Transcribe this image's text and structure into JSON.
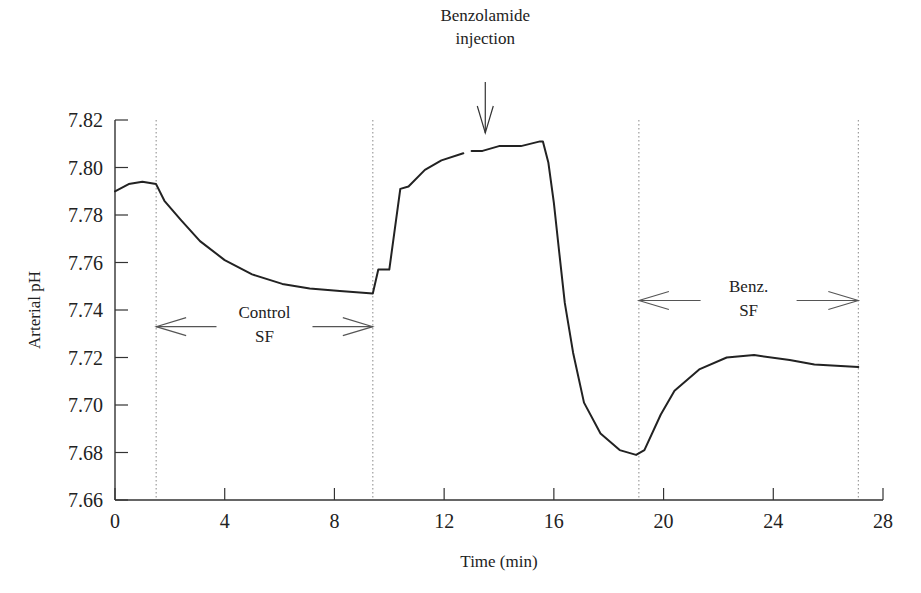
{
  "chart_data": {
    "type": "line",
    "title": "",
    "xlabel": "Time (min)",
    "ylabel": "Arterial pH",
    "xlim": [
      0,
      28
    ],
    "ylim": [
      7.66,
      7.82
    ],
    "x_ticks": [
      0,
      4,
      8,
      12,
      16,
      20,
      24,
      28
    ],
    "y_ticks": [
      "7.66",
      "7.68",
      "7.70",
      "7.72",
      "7.74",
      "7.76",
      "7.78",
      "7.80",
      "7.82"
    ],
    "grid": false,
    "legend": null,
    "series": [
      {
        "name": "Arterial pH",
        "color": "#222222",
        "points": [
          [
            0.0,
            7.79
          ],
          [
            0.5,
            7.793
          ],
          [
            1.0,
            7.794
          ],
          [
            1.5,
            7.793
          ],
          [
            1.8,
            7.786
          ],
          [
            2.4,
            7.778
          ],
          [
            3.1,
            7.769
          ],
          [
            4.0,
            7.761
          ],
          [
            5.0,
            7.755
          ],
          [
            6.1,
            7.751
          ],
          [
            7.1,
            7.749
          ],
          [
            8.2,
            7.748
          ],
          [
            9.4,
            7.747
          ],
          [
            9.6,
            7.757
          ],
          [
            10.0,
            7.757
          ],
          [
            10.4,
            7.791
          ],
          [
            10.7,
            7.792
          ],
          [
            11.3,
            7.799
          ],
          [
            11.9,
            7.803
          ],
          [
            12.7,
            7.806
          ]
        ]
      },
      {
        "name": "Arterial pH (cont.)",
        "color": "#222222",
        "points": [
          [
            13.0,
            7.807
          ],
          [
            13.4,
            7.807
          ],
          [
            14.0,
            7.809
          ],
          [
            14.8,
            7.809
          ],
          [
            15.5,
            7.811
          ],
          [
            15.6,
            7.811
          ],
          [
            15.8,
            7.802
          ],
          [
            16.0,
            7.785
          ],
          [
            16.2,
            7.764
          ],
          [
            16.4,
            7.743
          ],
          [
            16.7,
            7.722
          ],
          [
            17.1,
            7.701
          ],
          [
            17.7,
            7.688
          ],
          [
            18.4,
            7.681
          ],
          [
            19.0,
            7.679
          ],
          [
            19.3,
            7.681
          ],
          [
            19.9,
            7.696
          ],
          [
            20.4,
            7.706
          ],
          [
            21.3,
            7.715
          ],
          [
            22.3,
            7.72
          ],
          [
            23.3,
            7.721
          ],
          [
            24.6,
            7.719
          ],
          [
            25.5,
            7.717
          ],
          [
            27.1,
            7.716
          ]
        ]
      }
    ],
    "vertical_markers": [
      1.5,
      9.4,
      19.1,
      27.1
    ],
    "annotations": [
      {
        "text": [
          "Benzolamide",
          "injection"
        ],
        "type": "down-arrow",
        "x": 13.5,
        "arrow_tip_y": 7.812
      },
      {
        "text": [
          "Control",
          "SF"
        ],
        "type": "double-arrow",
        "x_from": 1.5,
        "x_to": 9.4,
        "y": 7.733
      },
      {
        "text": [
          "Benz.",
          "SF"
        ],
        "type": "double-arrow",
        "x_from": 19.1,
        "x_to": 27.1,
        "y": 7.744
      }
    ]
  }
}
